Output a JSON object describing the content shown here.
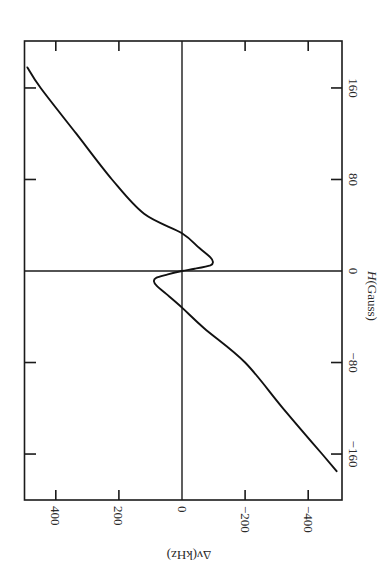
{
  "chart_data": {
    "type": "line",
    "orientation_note": "figure rotated 90 degrees clockwise on page",
    "title": "",
    "xlabel": "H(Gauss)",
    "ylabel": "Δν(kHz)",
    "xlim": [
      -180,
      180
    ],
    "ylim": [
      -500,
      500
    ],
    "x_ticks": [
      -160,
      -80,
      0,
      80,
      160
    ],
    "x_tick_labels": [
      "−160",
      "−80",
      "0",
      "80",
      "160"
    ],
    "y_ticks": [
      400,
      200,
      0,
      -200,
      -400
    ],
    "y_tick_labels": [
      "400",
      "200",
      "0",
      "−200",
      "−400"
    ],
    "grid": false,
    "zero_lines": true,
    "legend": null,
    "series": [
      {
        "name": "Δν vs H",
        "x": [
          178,
          160,
          120,
          80,
          50,
          33,
          20,
          12,
          8,
          5,
          2,
          0,
          -3,
          -6,
          -9,
          -13,
          -20,
          -32,
          -50,
          -80,
          -120,
          -160,
          -175
        ],
        "y": [
          490,
          448,
          335,
          222,
          120,
          0,
          -55,
          -90,
          -98,
          -90,
          -40,
          0,
          45,
          82,
          89,
          80,
          50,
          0,
          -70,
          -200,
          -320,
          -444,
          -490
        ]
      }
    ]
  },
  "labels": {
    "h_axis": "H(Gauss)",
    "h_axis_italic": "H",
    "h_axis_rest": "(Gauss)",
    "dv_axis": "Δν(kHz)"
  },
  "style": {
    "line_color": "#111111",
    "frame_color": "#1a1a1a",
    "background": "#ffffff"
  }
}
